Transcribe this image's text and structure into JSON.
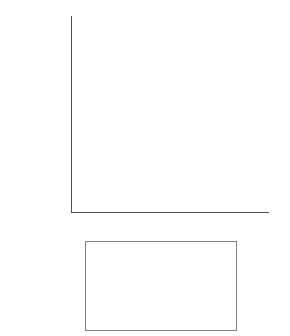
{
  "chart_data": {
    "type": "area",
    "stacked": true,
    "title": "",
    "xlabel": "",
    "ylabel": "unit: 1,000 ha",
    "ylim": [
      0,
      250000
    ],
    "ytick_labels": [
      "250,000",
      "200,000",
      "150,000",
      "100,000",
      "50,000",
      "0"
    ],
    "ytick_values": [
      250000,
      200000,
      150000,
      100000,
      50000,
      0
    ],
    "x": [
      "1970",
      "1975",
      "1980",
      "1985",
      "1996",
      "2006"
    ],
    "xtick_labels": [
      "1970",
      "1975",
      "1980",
      "1985",
      "1996",
      "2006"
    ],
    "grid": false,
    "legend_position": "below",
    "legend_order": [
      "Restored natural forest",
      "Permanent crop cultivation",
      "Temporary corp cultivation",
      "Primary and secondary forest",
      "Natural pasture",
      "Improved pasture"
    ],
    "series": [
      {
        "name": "Improved pasture",
        "fill": "#0d0d0d",
        "pattern": "solid",
        "values": [
          18000,
          23000,
          35000,
          49000,
          70000,
          77000
        ]
      },
      {
        "name": "Natural pasture",
        "fill": "#ffffff",
        "pattern": "dots",
        "values": [
          86000,
          80000,
          74000,
          64000,
          52000,
          33000
        ]
      },
      {
        "name": "Primary and secondary forest",
        "fill": "#6e6e6e",
        "pattern": "solid",
        "values": [
          28000,
          41000,
          53000,
          58000,
          58000,
          68000
        ]
      },
      {
        "name": "Temporary corp cultivation",
        "fill": "#b3b3b3",
        "pattern": "solid",
        "values": [
          8000,
          9000,
          12000,
          14000,
          16000,
          18000
        ]
      },
      {
        "name": "Permanent crop cultivation",
        "fill": "#f2f2f2",
        "pattern": "solid",
        "values": [
          2000,
          3000,
          5000,
          5000,
          5000,
          5000
        ]
      },
      {
        "name": "Restored natural forest",
        "fill": "#0d0d0d",
        "pattern": "solid",
        "values": [
          1500,
          2000,
          2500,
          2500,
          2500,
          2500
        ]
      }
    ],
    "totals": [
      143500,
      158000,
      181500,
      192500,
      203500,
      203500
    ]
  },
  "legend": {
    "items": [
      {
        "label": "Restored natural forest",
        "swatch": "black"
      },
      {
        "label": "Permanent crop cultivation",
        "swatch": "white"
      },
      {
        "label": "Temporary corp cultivation",
        "swatch": "ltgray"
      },
      {
        "label": "Primary and secondary forest",
        "swatch": "dkgray"
      },
      {
        "label": "Natural pasture",
        "swatch": "dots"
      },
      {
        "label": "Improved pasture",
        "swatch": "black"
      }
    ]
  }
}
